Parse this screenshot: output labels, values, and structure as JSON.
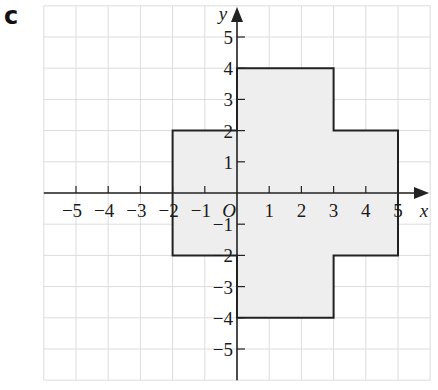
{
  "part_label": "c",
  "axes": {
    "x_label": "x",
    "y_label": "y",
    "origin_label": "O",
    "x_ticks": [
      -5,
      -4,
      -3,
      -2,
      -1,
      1,
      2,
      3,
      4,
      5
    ],
    "y_ticks": [
      5,
      4,
      3,
      2,
      1,
      -1,
      -2,
      -3,
      -4,
      -5
    ],
    "x_range": [
      -6,
      6
    ],
    "y_range": [
      -6,
      6
    ],
    "grid": true
  },
  "shape": {
    "name": "cross-shaped polygon",
    "fill": "#eeeeee",
    "stroke": "#222222",
    "vertices": [
      [
        0,
        4
      ],
      [
        3,
        4
      ],
      [
        3,
        2
      ],
      [
        5,
        2
      ],
      [
        5,
        -2
      ],
      [
        3,
        -2
      ],
      [
        3,
        -4
      ],
      [
        0,
        -4
      ],
      [
        0,
        -2
      ],
      [
        -2,
        -2
      ],
      [
        -2,
        2
      ],
      [
        0,
        2
      ]
    ]
  },
  "colors": {
    "grid": "#dcdcdc",
    "axis": "#222222"
  }
}
